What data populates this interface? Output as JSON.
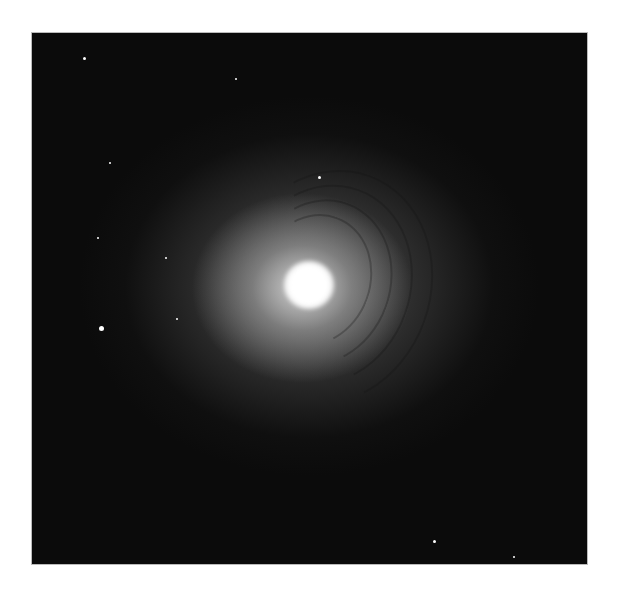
{
  "image": {
    "subject": "elliptical galaxy with concentric dust shells",
    "colors": {
      "background": "#ffffff",
      "sky": "#0b0b0b",
      "core": "#ffffff"
    },
    "stars": [
      {
        "x": 83,
        "y": 57,
        "r": 1.5
      },
      {
        "x": 235,
        "y": 78,
        "r": 1
      },
      {
        "x": 109,
        "y": 162,
        "r": 1
      },
      {
        "x": 318,
        "y": 176,
        "r": 1.5
      },
      {
        "x": 97,
        "y": 237,
        "r": 1
      },
      {
        "x": 165,
        "y": 257,
        "r": 1
      },
      {
        "x": 100,
        "y": 327,
        "r": 2.5
      },
      {
        "x": 176,
        "y": 318,
        "r": 1
      },
      {
        "x": 433,
        "y": 540,
        "r": 1.5
      },
      {
        "x": 513,
        "y": 556,
        "r": 1
      }
    ]
  }
}
